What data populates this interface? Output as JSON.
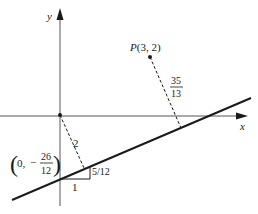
{
  "diagram": {
    "axes": {
      "x_label": "x",
      "y_label": "y"
    },
    "point": {
      "label_name": "P",
      "label_coords": "(3, 2)"
    },
    "intercept": {
      "open_paren": "(",
      "x_part": "0,",
      "minus": "−",
      "numerator": "26",
      "denominator": "12",
      "close_paren": ")"
    },
    "distance_origin_label": "2",
    "distance_point": {
      "numerator": "35",
      "denominator": "13"
    },
    "slope_triangle": {
      "run_label": "1",
      "rise_label": "5/12"
    },
    "colors": {
      "ink": "#1a1a1a",
      "axis": "#555555",
      "background": "#ffffff"
    }
  }
}
